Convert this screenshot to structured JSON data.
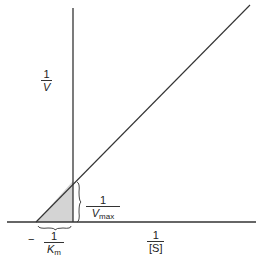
{
  "diagram": {
    "y_axis_label": {
      "numerator": "1",
      "denominator": "V"
    },
    "x_axis_label": {
      "numerator": "1",
      "denominator": "[S]"
    },
    "y_intercept_label": {
      "numerator": "1",
      "denominator_main": "V",
      "denominator_sub": "max"
    },
    "x_intercept_label": {
      "sign": "−",
      "numerator": "1",
      "denominator_main": "K",
      "denominator_sub": "m"
    },
    "colors": {
      "line": "#333333",
      "shading": "#d4d4d4"
    }
  }
}
